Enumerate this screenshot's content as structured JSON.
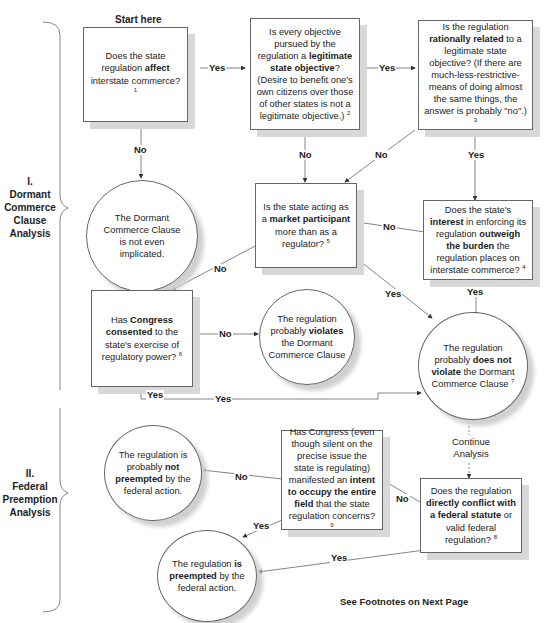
{
  "diagram": {
    "start_label": "Start here",
    "footer_note": "See Footnotes on Next Page",
    "sections": [
      {
        "number": "I.",
        "title_lines": [
          "Dormant",
          "Commerce",
          "Clause",
          "Analysis"
        ]
      },
      {
        "number": "II.",
        "title_lines": [
          "Federal",
          "Preemption",
          "Analysis"
        ]
      }
    ],
    "nodes": {
      "q1": {
        "pre": "Does the state regulation ",
        "bold": "affect",
        "post": " interstate commerce?",
        "fn": "1"
      },
      "q2": {
        "pre": "Is every objective pursued by the regulation a ",
        "bold": "legitimate state objective",
        "post": "? (Desire to benefit one's own citizens over those of other states is not a legitimate objective.)",
        "fn": "2"
      },
      "q3": {
        "pre": "Is the regulation ",
        "bold": "rationally related",
        "post": " to a legitimate state objective? (If there are much-less-restrictive-means of doing almost the same things, the answer is probably \"no\".)",
        "fn": "3"
      },
      "r1": {
        "text": "The Dormant Commerce Clause is not even implicated."
      },
      "q5": {
        "pre": "Is the state acting as a ",
        "bold": "market participant",
        "post": " more than as a regulator?",
        "fn": "5"
      },
      "q4": {
        "pre": "Does the state's ",
        "bold": "interest",
        "mid": " in enforcing its regulation ",
        "bold2": "outweigh  the burden",
        "post": " the regulation places on interstate commerce?",
        "fn": "4"
      },
      "q6": {
        "pre": "Has ",
        "bold": "Congress consented",
        "post": " to the state's exercise of regulatory power?",
        "fn": "6"
      },
      "r2": {
        "pre": "The regulation probably ",
        "bold": "violates",
        "post": " the Dormant Commerce Clause"
      },
      "r3": {
        "pre": "The regulation probably ",
        "bold": "does not violate",
        "post": " the Dormant Commerce Clause",
        "fn": "7"
      },
      "r4": {
        "pre": "The regulation is probably ",
        "bold": "not preempted",
        "post": " by the federal action."
      },
      "q9": {
        "pre": "Has Congress (even though silent on the precise issue the state is regulating) manifested an ",
        "bold": "intent to occupy the entire field",
        "post": " that the state regulation concerns?",
        "fn": "9"
      },
      "q8": {
        "pre": "Does the regulation ",
        "bold": "directly conflict with a federal statute",
        "post": " or valid federal regulation?",
        "fn": "8"
      },
      "r5": {
        "pre": "The regulation ",
        "bold": "is preempted",
        "post": " by the federal action."
      }
    },
    "edge_labels": {
      "q1_yes": "Yes",
      "q1_no": "No",
      "q2_yes": "Yes",
      "q2_no": "No",
      "q3_no": "No",
      "q3_yes": "Yes",
      "q4_no": "No",
      "q4_yes": "Yes",
      "q5_no": "No",
      "q5_yes": "Yes",
      "q6_no": "No",
      "q6_yes_a": "Yes",
      "q6_yes_b": "Yes",
      "continue": "Continue Analysis",
      "q8_no": "No",
      "q8_yes": "Yes",
      "q9_no": "No",
      "q9_yes": "Yes"
    },
    "colors": {
      "line": "#555555",
      "shadow": "#d8d8d8"
    }
  }
}
